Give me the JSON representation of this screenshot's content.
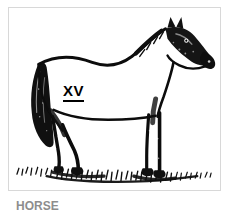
{
  "figure": {
    "plate_number": "XV",
    "caption": "HORSE",
    "subject": "horse",
    "orientation": "facing right",
    "style": "black and white pen and ink line drawing",
    "ground": "grass tufts",
    "colors": {
      "ink": "#000000",
      "background": "#ffffff",
      "frame": "#d8d8d8",
      "caption_text": "#8d8d8d"
    }
  }
}
